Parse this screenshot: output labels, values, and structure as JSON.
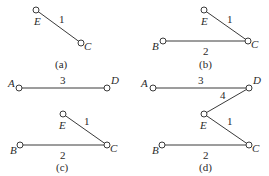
{
  "panels": {
    "a": {
      "caption": "(a)",
      "nodes": {
        "E": "E",
        "C": "C"
      },
      "edges": [
        {
          "from": "E",
          "to": "C",
          "label": "1"
        }
      ]
    },
    "b": {
      "caption": "(b)",
      "nodes": {
        "E": "E",
        "C": "C",
        "B": "B"
      },
      "edges": [
        {
          "from": "E",
          "to": "C",
          "label": "1"
        },
        {
          "from": "B",
          "to": "C",
          "label": "2"
        }
      ]
    },
    "c": {
      "caption": "(c)",
      "nodes": {
        "A": "A",
        "D": "D",
        "E": "E",
        "C": "C",
        "B": "B"
      },
      "edges": [
        {
          "from": "A",
          "to": "D",
          "label": "3"
        },
        {
          "from": "E",
          "to": "C",
          "label": "1"
        },
        {
          "from": "B",
          "to": "C",
          "label": "2"
        }
      ]
    },
    "d": {
      "caption": "(d)",
      "nodes": {
        "A": "A",
        "D": "D",
        "E": "E",
        "C": "C",
        "B": "B"
      },
      "edges": [
        {
          "from": "A",
          "to": "D",
          "label": "3"
        },
        {
          "from": "D",
          "to": "E",
          "label": "4"
        },
        {
          "from": "E",
          "to": "C",
          "label": "1"
        },
        {
          "from": "B",
          "to": "C",
          "label": "2"
        }
      ]
    }
  },
  "colors": {
    "line": "#3a3a3a",
    "text": "#2a2a2a",
    "background": "#ffffff"
  }
}
